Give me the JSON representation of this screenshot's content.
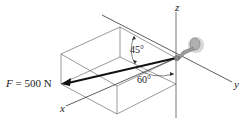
{
  "diagram": {
    "force": {
      "symbol": "F",
      "equals": " = ",
      "magnitude": "500 N",
      "label": "F = 500 N"
    },
    "axes": {
      "x": "x",
      "y": "y",
      "z": "z"
    },
    "angles": {
      "upper": "45°",
      "lower": "60°"
    },
    "colors": {
      "line": "#333333",
      "arrow": "#111111",
      "support_fill": "#9a9a9a",
      "support_glow": "#d8d8d8"
    }
  }
}
